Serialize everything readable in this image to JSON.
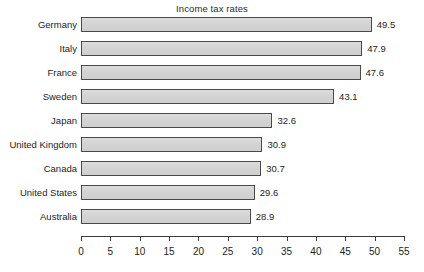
{
  "chart_data": {
    "type": "bar",
    "orientation": "horizontal",
    "title": "Income tax rates",
    "xlabel": "",
    "ylabel": "",
    "categories": [
      "Germany",
      "Italy",
      "France",
      "Sweden",
      "Japan",
      "United Kingdom",
      "Canada",
      "United States",
      "Australia"
    ],
    "values": [
      49.5,
      47.9,
      47.6,
      43.1,
      32.6,
      30.9,
      30.7,
      29.6,
      28.9
    ],
    "value_labels": [
      "49.5",
      "47.9",
      "47.6",
      "43.1",
      "32.6",
      "30.9",
      "30.7",
      "29.6",
      "28.9"
    ],
    "xlim": [
      0,
      55
    ],
    "xticks": [
      0,
      5,
      10,
      15,
      20,
      25,
      30,
      35,
      40,
      45,
      50,
      55
    ],
    "xtick_labels": [
      "0",
      "5",
      "10",
      "15",
      "20",
      "25",
      "30",
      "35",
      "40",
      "45",
      "50",
      "55"
    ],
    "grid": false,
    "legend": false,
    "bar_fill_color": "#d5d5d5",
    "bar_border_color": "#4a4a4a",
    "background_color": "#ffffff",
    "text_color": "#1d1d1d"
  }
}
